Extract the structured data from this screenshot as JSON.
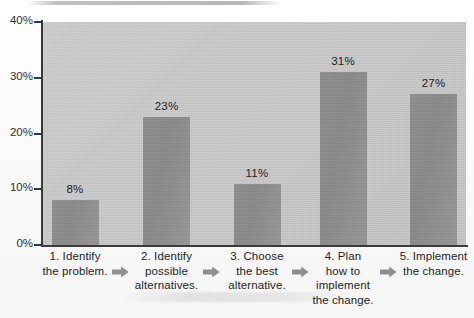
{
  "chart_data": {
    "type": "bar",
    "title": "",
    "subtitle": "",
    "xlabel": "",
    "ylabel": "",
    "ylim": [
      0,
      40
    ],
    "y_ticks": [
      "0%",
      "10%",
      "20%",
      "30%",
      "40%"
    ],
    "y_tick_values": [
      0,
      10,
      20,
      30,
      40
    ],
    "grid": false,
    "legend": "none",
    "categories": [
      "1. Identify the problem.",
      "2. Identify possible alternatives.",
      "3. Choose the best alternative.",
      "4. Plan how to implement the change.",
      "5. Implement the change."
    ],
    "category_lines": [
      [
        "1. Identify",
        "the problem."
      ],
      [
        "2. Identify",
        "possible",
        "alternatives."
      ],
      [
        "3. Choose",
        "the best",
        "alternative."
      ],
      [
        "4. Plan",
        "how to",
        "implement",
        "the change."
      ],
      [
        "5. Implement",
        "the change."
      ]
    ],
    "values": [
      8,
      23,
      11,
      31,
      27
    ],
    "value_labels": [
      "8%",
      "23%",
      "11%",
      "31%",
      "27%"
    ],
    "colors": {
      "bar": "#8d8d8d",
      "plot_background": "#c6c6c6",
      "axis": "#3a3a3a",
      "text": "#242424",
      "page_background": "#fbfbfb",
      "arrow": "#8f8f8f"
    },
    "connectors": {
      "count": 4,
      "icon": "right-arrow-icon"
    }
  }
}
